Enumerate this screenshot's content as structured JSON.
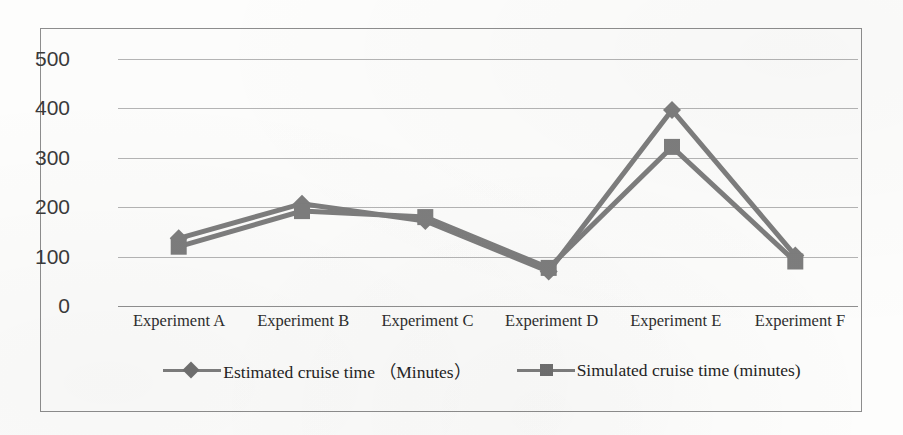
{
  "chart_data": {
    "type": "line",
    "title": "",
    "xlabel": "",
    "ylabel": "",
    "categories": [
      "Experiment A",
      "Experiment B",
      "Experiment C",
      "Experiment D",
      "Experiment E",
      "Experiment F"
    ],
    "series": [
      {
        "name": "Estimated cruise time （Minutes）",
        "marker": "diamond",
        "color": "#7d7d7d",
        "values": [
          135,
          205,
          170,
          68,
          395,
          100
        ]
      },
      {
        "name": "Simulated cruise time (minutes)",
        "marker": "square",
        "color": "#7d7d7d",
        "values": [
          118,
          190,
          178,
          75,
          320,
          88
        ]
      }
    ],
    "ylim": [
      0,
      500
    ],
    "yticks": [
      0,
      100,
      200,
      300,
      400,
      500
    ],
    "ytick_labels": [
      "0",
      "100",
      "200",
      "300",
      "400",
      "500"
    ],
    "grid": true,
    "legend_position": "bottom"
  },
  "axes": {
    "y_tick_labels": [
      "500",
      "400",
      "300",
      "200",
      "100",
      "0"
    ]
  },
  "legend": {
    "entries": [
      {
        "label": "Estimated cruise time （Minutes）",
        "marker": "diamond"
      },
      {
        "label": "Simulated cruise time (minutes)",
        "marker": "square"
      }
    ]
  },
  "colors": {
    "series_gray": "#7d7d7d",
    "gridline": "#b4b4b4",
    "border": "#8d8d8d",
    "text": "#2e2e2e",
    "background": "#fcfcfb"
  }
}
